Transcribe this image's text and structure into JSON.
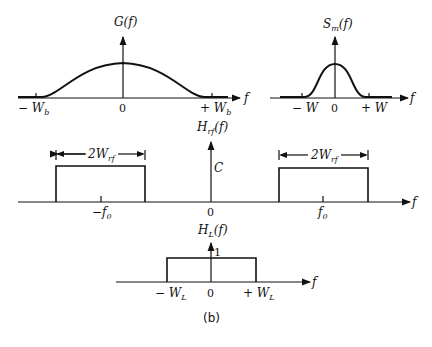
{
  "figure_caption": "(b)",
  "panels": {
    "baseband": {
      "ylabel": "G(f)",
      "xlabel": "f",
      "ticks": [
        "−W_b",
        "0",
        "+W_b"
      ],
      "tick_text": {
        "neg": "− W",
        "neg_sub": "b",
        "zero": "0",
        "pos": "+ W",
        "pos_sub": "b"
      }
    },
    "message": {
      "ylabel_main": "S",
      "ylabel_sub": "m",
      "ylabel_rest": "(f)",
      "xlabel": "f",
      "tick_text": {
        "neg": "− W",
        "zero": "0",
        "pos": "+ W"
      }
    },
    "rf_filter": {
      "ylabel_main": "H",
      "ylabel_sub": "rf",
      "ylabel_rest": "(f)",
      "xlabel": "f",
      "level_label": "C",
      "width_label_main": "2W",
      "width_label_sub": "rf",
      "tick_text": {
        "neg": "−f",
        "neg_sub": "0",
        "zero": "0",
        "pos": "f",
        "pos_sub": "0"
      }
    },
    "lowpass": {
      "ylabel_main": "H",
      "ylabel_sub": "L",
      "ylabel_rest": "(f)",
      "xlabel": "f",
      "level_label": "1",
      "tick_text": {
        "neg": "− W",
        "neg_sub": "L",
        "zero": "0",
        "pos": "+ W",
        "pos_sub": "L"
      }
    }
  }
}
